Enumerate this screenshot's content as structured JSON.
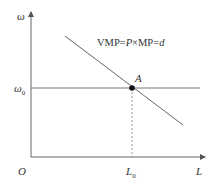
{
  "diagram": {
    "type": "labor-demand",
    "y_axis_label": "ω",
    "x_axis_label": "L",
    "origin_label": "O",
    "wage_level": {
      "symbol": "ω",
      "subscript": "0"
    },
    "labor_level": {
      "symbol": "L",
      "subscript": "0"
    },
    "equilibrium_point": "A",
    "curve_label": {
      "prefix": "VMP=",
      "p": "P",
      "times": "×MP=",
      "d": "d"
    }
  },
  "colors": {
    "line": "#555555",
    "point": "#111111"
  }
}
